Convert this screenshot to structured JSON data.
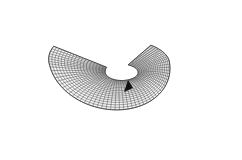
{
  "figure": {
    "description": "3D wireframe mesh surface with a funnel-shaped depression",
    "mesh_color": "#3a3a3a",
    "background": "#ffffff",
    "hole_color": "#111111"
  }
}
